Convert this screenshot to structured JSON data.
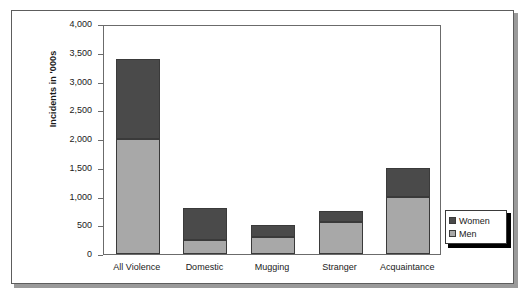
{
  "chart_data": {
    "type": "bar",
    "subtype": "stacked-vertical-bar",
    "title": "",
    "xlabel": "",
    "ylabel": "Incidents in '000s",
    "categories": [
      "All Violence",
      "Domestic",
      "Mugging",
      "Stranger",
      "Acquaintance"
    ],
    "series": [
      {
        "name": "Men",
        "color": "#a8a8a8",
        "values": [
          2000,
          250,
          300,
          550,
          1000
        ]
      },
      {
        "name": "Women",
        "color": "#4a4a4a",
        "values": [
          1400,
          550,
          200,
          200,
          500
        ]
      }
    ],
    "totals": [
      3400,
      800,
      500,
      750,
      1500
    ],
    "stack_order": [
      "Men",
      "Women"
    ],
    "ylim": [
      0,
      4000
    ],
    "y_ticks": [
      0,
      500,
      1000,
      1500,
      2000,
      2500,
      3000,
      3500,
      4000
    ],
    "y_tick_labels": [
      "0",
      "500",
      "1,000",
      "1,500",
      "2,000",
      "2,500",
      "3,000",
      "3,500",
      "4,000"
    ],
    "grid": false,
    "legend_position": "right-outside",
    "legend_entries": [
      "Women",
      "Men"
    ]
  },
  "legend": {
    "items": [
      {
        "label": "Women",
        "color": "#4a4a4a"
      },
      {
        "label": "Men",
        "color": "#a8a8a8"
      }
    ]
  },
  "colors": {
    "women": "#4a4a4a",
    "men": "#a8a8a8",
    "axis": "#6b6b6b",
    "frame": "#5d5d5d",
    "text": "#1a1a1a",
    "background": "#ffffff"
  }
}
